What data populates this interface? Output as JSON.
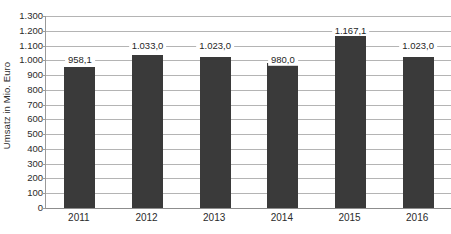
{
  "chart_data": {
    "type": "bar",
    "title": "",
    "xlabel": "",
    "ylabel": "Umsatz in Mio. Euro",
    "categories": [
      "2011",
      "2012",
      "2013",
      "2014",
      "2015",
      "2016"
    ],
    "values": [
      958.1,
      1033.0,
      1023.0,
      980.0,
      1167.1,
      1023.0
    ],
    "value_labels": [
      "958,1",
      "1.033,0",
      "1.023,0",
      "980,0",
      "1.167,1",
      "1.023,0"
    ],
    "label_gridline_values": [
      1000,
      1100,
      1100,
      1000,
      1200,
      1100
    ],
    "ylim": [
      0,
      1300
    ],
    "ytick_values": [
      0,
      100,
      200,
      300,
      400,
      500,
      600,
      700,
      800,
      900,
      1000,
      1100,
      1200,
      1300
    ],
    "ytick_labels": [
      "0",
      "100",
      "200",
      "300",
      "400",
      "500",
      "600",
      "700",
      "800",
      "900",
      "1.000",
      "1.100",
      "1.200",
      "1.300"
    ],
    "grid": true,
    "legend": false,
    "legend_position": "none",
    "series": [
      {
        "name": "Umsatz",
        "values": [
          958.1,
          1033.0,
          1023.0,
          980.0,
          1167.1,
          1023.0
        ]
      }
    ],
    "colors": {
      "bar_fill": "#3a3a3a",
      "gridline": "#b4b4b4",
      "axis_line": "#9a9a9a",
      "text": "#2b2b2b",
      "background": "#ffffff"
    }
  }
}
